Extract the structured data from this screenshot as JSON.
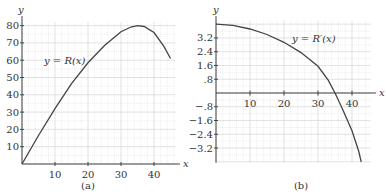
{
  "chart_data": [
    {
      "type": "line",
      "caption": "(a)",
      "xlabel": "x",
      "ylabel": "y",
      "curve_label": "y = R(x)",
      "xlim": [
        0,
        45
      ],
      "ylim": [
        0,
        82
      ],
      "xticks": [
        10,
        20,
        30,
        40
      ],
      "yticks": [
        10,
        20,
        30,
        40,
        50,
        60,
        70,
        80
      ],
      "grid": true,
      "series": [
        {
          "name": "R(x)",
          "x": [
            0,
            5,
            10,
            15,
            20,
            25,
            30,
            33,
            35,
            37,
            40,
            43,
            45
          ],
          "y": [
            0,
            16.5,
            32,
            46.5,
            58.5,
            68.5,
            76.5,
            79.2,
            80,
            79.5,
            76,
            68,
            61
          ]
        }
      ]
    },
    {
      "type": "line",
      "caption": "(b)",
      "xlabel": "x",
      "ylabel": "y",
      "curve_label": "y = R′(x)",
      "xlim": [
        0,
        45
      ],
      "ylim": [
        -4.0,
        4.2
      ],
      "xticks": [
        10,
        20,
        30,
        40
      ],
      "yticks": [
        3.2,
        2.4,
        1.6,
        0.8,
        -0.8,
        -1.6,
        -2.4,
        -3.2
      ],
      "ytick_labels": [
        "3.2",
        "2.4",
        "1.6",
        ".8",
        "−.8",
        "−1.6",
        "−2.4",
        "−3.2"
      ],
      "grid": true,
      "series": [
        {
          "name": "R′(x)",
          "x": [
            0,
            5,
            10,
            15,
            20,
            25,
            30,
            33,
            35,
            37,
            40,
            42,
            42.7
          ],
          "y": [
            4.0,
            3.93,
            3.72,
            3.4,
            2.95,
            2.35,
            1.55,
            0.75,
            0.0,
            -0.85,
            -2.2,
            -3.4,
            -4.0
          ]
        }
      ]
    }
  ]
}
